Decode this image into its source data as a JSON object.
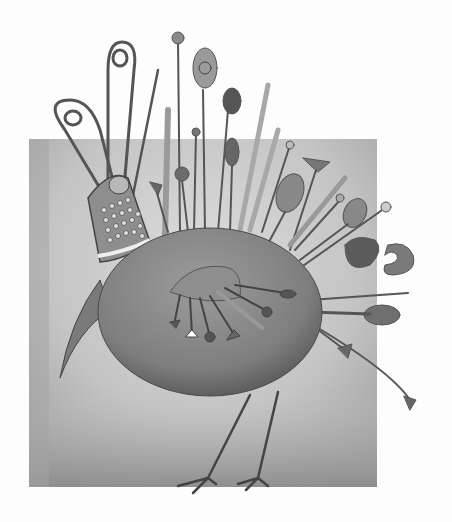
{
  "image": {
    "subject": "pincushion-bird",
    "alt": "Grayscale illustration of a round bird-shaped pincushion studded with pins, needles, safety pins and a thimble, standing on thin legs against a gray square",
    "colors": {
      "page": "#fdfdfd",
      "square": "#bdbdbd",
      "square_light": "#d9d9d9",
      "body": "#8a8a8a",
      "body_dark": "#5e5e5e",
      "metal": "#a8a8a8",
      "ink": "#3a3a3a"
    }
  }
}
